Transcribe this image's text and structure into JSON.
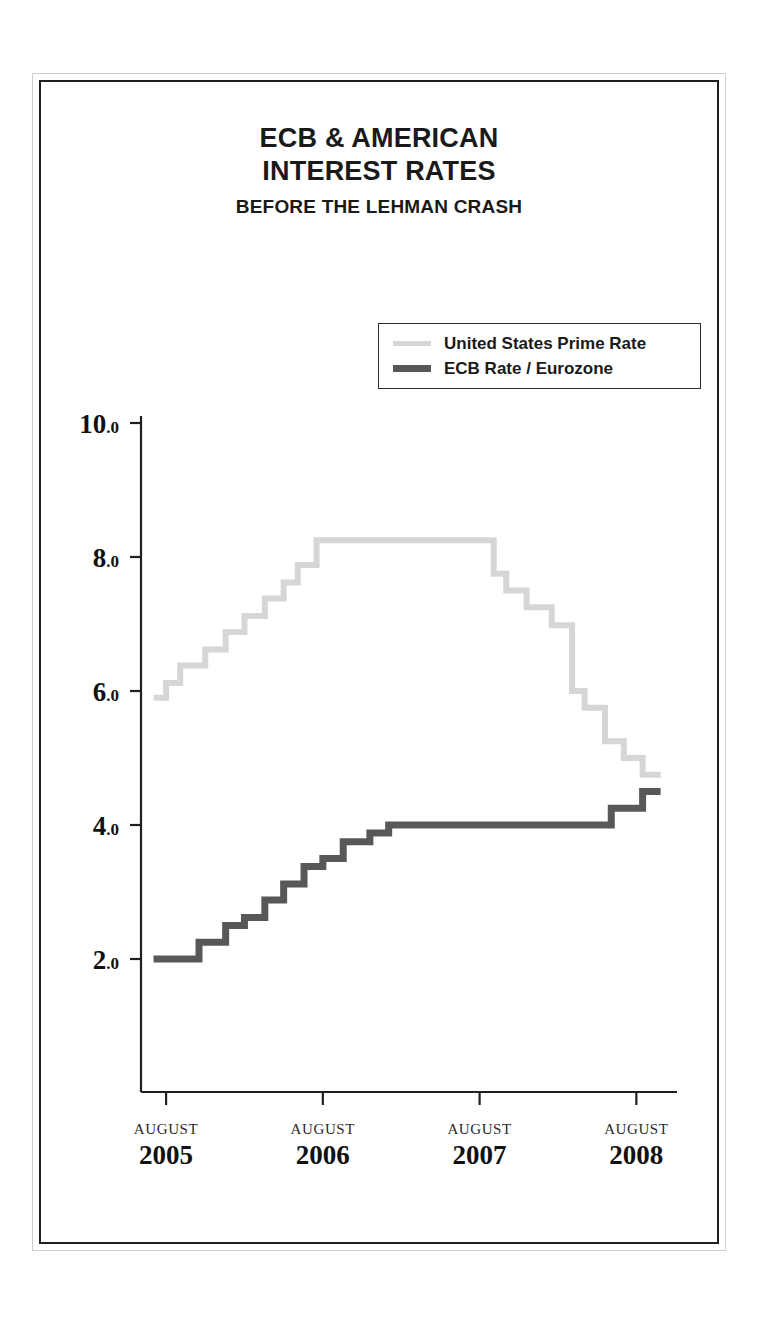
{
  "figure": {
    "title_line_1": "ECB & AMERICAN",
    "title_line_2": "INTEREST RATES",
    "subtitle": "BEFORE THE LEHMAN CRASH"
  },
  "legend": {
    "position": "upper-center-right",
    "items": [
      {
        "label": "United States Prime Rate",
        "color": "#d6d6d6"
      },
      {
        "label": "ECB Rate / Eurozone",
        "color": "#585858"
      }
    ]
  },
  "chart_data": {
    "type": "line",
    "style": "step-post",
    "title": "ECB & AMERICAN INTEREST RATES",
    "subtitle": "BEFORE THE LEHMAN CRASH",
    "xlabel": "",
    "ylabel": "",
    "grid": false,
    "ylim": [
      0.6,
      10.0
    ],
    "yticks": [
      2.0,
      4.0,
      6.0,
      8.0,
      10.0
    ],
    "ytick_labels": [
      "2.0",
      "4.0",
      "6.0",
      "8.0",
      "10.0"
    ],
    "xlim": [
      2005.42,
      2008.75
    ],
    "xticks": [
      2005.58,
      2006.58,
      2007.58,
      2008.58
    ],
    "xtick_months": [
      "AUGUST",
      "AUGUST",
      "AUGUST",
      "AUGUST"
    ],
    "xtick_years": [
      "2005",
      "2006",
      "2007",
      "2008"
    ],
    "series": [
      {
        "name": "United States Prime Rate",
        "color": "#d6d6d6",
        "line_width": 6,
        "x": [
          2005.5,
          2005.58,
          2005.67,
          2005.83,
          2005.96,
          2006.08,
          2006.21,
          2006.33,
          2006.42,
          2006.54,
          2007.67,
          2007.75,
          2007.88,
          2008.04,
          2008.17,
          2008.25,
          2008.38,
          2008.5,
          2008.62
        ],
        "y": [
          5.9,
          6.12,
          6.38,
          6.62,
          6.88,
          7.12,
          7.38,
          7.62,
          7.88,
          8.25,
          7.75,
          7.5,
          7.25,
          6.98,
          6.0,
          5.75,
          5.25,
          5.0,
          4.75
        ]
      },
      {
        "name": "ECB Rate / Eurozone",
        "color": "#585858",
        "line_width": 7,
        "x": [
          2005.5,
          2005.79,
          2005.96,
          2006.08,
          2006.21,
          2006.33,
          2006.46,
          2006.58,
          2006.71,
          2006.88,
          2007.0,
          2008.42,
          2008.62
        ],
        "y": [
          2.0,
          2.25,
          2.5,
          2.62,
          2.88,
          3.12,
          3.38,
          3.5,
          3.75,
          3.88,
          4.0,
          4.25,
          4.5
        ]
      }
    ]
  }
}
